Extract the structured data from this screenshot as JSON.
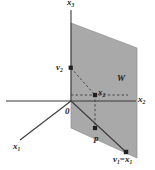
{
  "figure": {
    "colors": {
      "plane_fill": "#a9a9a9",
      "plane_edge": "#7d7d7d",
      "axis": "#3b3b3b",
      "dashed": "#3b3b3b",
      "label": "#231f20",
      "background": "#ffffff"
    },
    "labels": {
      "x3_axis": "x",
      "x3_axis_sub": "3",
      "x2_axis": "x",
      "x2_axis_sub": "2",
      "x1_axis": "x",
      "x1_axis_sub": "1",
      "v2": "v",
      "v2_sub": "2",
      "subspace": "W",
      "x2_point": "x",
      "x2_point_sub": "2",
      "origin": "0",
      "projection": "p",
      "v1": "v",
      "v1_sub": "1",
      "equals": "=",
      "x1_point": "x",
      "x1_point_sub": "1"
    },
    "points": [
      {
        "name": "origin",
        "label": "0",
        "x": 71,
        "y": 101
      },
      {
        "name": "v2",
        "label": "v2",
        "x": 71,
        "y": 68
      },
      {
        "name": "x2",
        "label": "x2",
        "x": 95,
        "y": 95
      },
      {
        "name": "p",
        "label": "p",
        "x": 95,
        "y": 128
      },
      {
        "name": "v1x1",
        "label": "v1=x1",
        "x": 126,
        "y": 152
      }
    ]
  }
}
